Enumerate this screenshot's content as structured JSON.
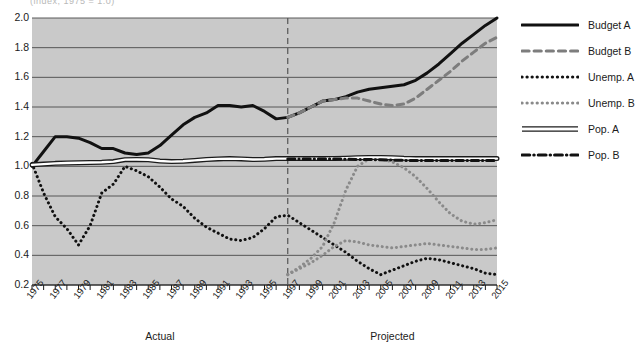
{
  "cut_title": "(index, 1975 = 1.0)",
  "chart_data": {
    "type": "line",
    "title": "",
    "xlabel": "",
    "ylabel": "",
    "xlim": [
      1975,
      2015
    ],
    "ylim": [
      0.2,
      2.0
    ],
    "ytick_labels": [
      "2.0",
      "1.8",
      "1.6",
      "1.4",
      "1.2",
      "1.0",
      "0.8",
      "0.6",
      "0.4",
      "0.2"
    ],
    "ytick_values": [
      2.0,
      1.8,
      1.6,
      1.4,
      1.2,
      1.0,
      0.8,
      0.6,
      0.4,
      0.2
    ],
    "xtick_labels": [
      "1975",
      "1977",
      "1979",
      "1981",
      "1983",
      "1985",
      "1987",
      "1989",
      "1991",
      "1993",
      "1995",
      "1997",
      "1999",
      "2001",
      "2003",
      "2005",
      "2007",
      "2009",
      "2011",
      "2013",
      "2015"
    ],
    "xtick_values": [
      1975,
      1977,
      1979,
      1981,
      1983,
      1985,
      1987,
      1989,
      1991,
      1993,
      1995,
      1997,
      1999,
      2001,
      2003,
      2005,
      2007,
      2009,
      2011,
      2013,
      2015
    ],
    "minor_ticks": true,
    "grid": "horizontal",
    "plot_background": "#c9c9c9",
    "divider": {
      "x": 1997,
      "style": "dashed",
      "color": "#555555"
    },
    "region_labels": [
      {
        "text": "Actual",
        "center_x": 1986
      },
      {
        "text": "Projected",
        "center_x": 2006
      }
    ],
    "x": [
      1975,
      1976,
      1977,
      1978,
      1979,
      1980,
      1981,
      1982,
      1983,
      1984,
      1985,
      1986,
      1987,
      1988,
      1989,
      1990,
      1991,
      1992,
      1993,
      1994,
      1995,
      1996,
      1997,
      1998,
      1999,
      2000,
      2001,
      2002,
      2003,
      2004,
      2005,
      2006,
      2007,
      2008,
      2009,
      2010,
      2011,
      2012,
      2013,
      2014,
      2015
    ],
    "series": [
      {
        "name": "Budget A",
        "style": "solid",
        "color": "#111111",
        "width": 3,
        "values": [
          1.0,
          1.1,
          1.2,
          1.2,
          1.19,
          1.16,
          1.12,
          1.12,
          1.09,
          1.08,
          1.09,
          1.14,
          1.21,
          1.28,
          1.33,
          1.36,
          1.41,
          1.41,
          1.4,
          1.41,
          1.37,
          1.32,
          1.33,
          1.36,
          1.4,
          1.44,
          1.45,
          1.47,
          1.5,
          1.52,
          1.53,
          1.54,
          1.55,
          1.58,
          1.63,
          1.69,
          1.76,
          1.83,
          1.89,
          1.95,
          2.0
        ]
      },
      {
        "name": "Budget B",
        "style": "dashed",
        "color": "#7d7d7d",
        "width": 3,
        "values": [
          null,
          null,
          null,
          null,
          null,
          null,
          null,
          null,
          null,
          null,
          null,
          null,
          null,
          null,
          null,
          null,
          null,
          null,
          null,
          null,
          null,
          null,
          1.33,
          1.36,
          1.4,
          1.44,
          1.45,
          1.46,
          1.46,
          1.44,
          1.42,
          1.41,
          1.42,
          1.46,
          1.52,
          1.58,
          1.64,
          1.71,
          1.77,
          1.83,
          1.87
        ]
      },
      {
        "name": "Unemp. A",
        "style": "dotted",
        "color": "#111111",
        "width": 3,
        "values": [
          1.02,
          0.82,
          0.66,
          0.58,
          0.47,
          0.6,
          0.82,
          0.88,
          1.0,
          0.97,
          0.93,
          0.86,
          0.78,
          0.73,
          0.65,
          0.59,
          0.55,
          0.51,
          0.5,
          0.52,
          0.58,
          0.66,
          0.67,
          0.62,
          0.57,
          0.52,
          0.47,
          0.42,
          0.36,
          0.31,
          0.27,
          0.3,
          0.33,
          0.36,
          0.38,
          0.37,
          0.35,
          0.33,
          0.31,
          0.28,
          0.27
        ]
      },
      {
        "name": "Unemp. B",
        "style": "dotted",
        "color": "#8a8a8a",
        "width": 3,
        "values": [
          null,
          null,
          null,
          null,
          null,
          null,
          null,
          null,
          null,
          null,
          null,
          null,
          null,
          null,
          null,
          null,
          null,
          null,
          null,
          null,
          null,
          null,
          0.27,
          0.31,
          0.35,
          0.4,
          0.46,
          0.5,
          0.49,
          0.47,
          0.46,
          0.45,
          0.46,
          0.47,
          0.48,
          0.47,
          0.46,
          0.45,
          0.44,
          0.44,
          0.45
        ]
      },
      {
        "name": "Unemp. B proj",
        "style": "dotted",
        "color": "#8a8a8a",
        "width": 3,
        "hide_from_legend": true,
        "values": [
          null,
          null,
          null,
          null,
          null,
          null,
          null,
          null,
          null,
          null,
          null,
          null,
          null,
          null,
          null,
          null,
          null,
          null,
          null,
          null,
          null,
          null,
          0.27,
          0.32,
          0.38,
          0.46,
          0.62,
          0.84,
          1.0,
          1.05,
          1.05,
          1.03,
          0.99,
          0.93,
          0.85,
          0.76,
          0.68,
          0.63,
          0.61,
          0.62,
          0.64
        ]
      },
      {
        "name": "Pop. A",
        "style": "outlined",
        "color": "#ffffff",
        "width": 3,
        "values": [
          1.01,
          1.015,
          1.02,
          1.022,
          1.024,
          1.026,
          1.028,
          1.032,
          1.045,
          1.046,
          1.044,
          1.036,
          1.032,
          1.034,
          1.04,
          1.046,
          1.05,
          1.052,
          1.05,
          1.046,
          1.048,
          1.052,
          1.052,
          1.052,
          1.052,
          1.052,
          1.053,
          1.055,
          1.058,
          1.06,
          1.06,
          1.058,
          1.054,
          1.052,
          1.052,
          1.052,
          1.052,
          1.052,
          1.052,
          1.052,
          1.052
        ]
      },
      {
        "name": "Pop. B",
        "style": "dashdot",
        "color": "#111111",
        "width": 3,
        "values": [
          null,
          null,
          null,
          null,
          null,
          null,
          null,
          null,
          null,
          null,
          null,
          null,
          null,
          null,
          null,
          null,
          null,
          null,
          null,
          null,
          null,
          null,
          1.05,
          1.05,
          1.05,
          1.05,
          1.05,
          1.048,
          1.046,
          1.046,
          1.044,
          1.042,
          1.04,
          1.04,
          1.04,
          1.04,
          1.04,
          1.04,
          1.04,
          1.04,
          1.04
        ]
      }
    ]
  },
  "legend": {
    "items": [
      {
        "label": "Budget A",
        "style": "solid",
        "color": "#111111"
      },
      {
        "label": "Budget B",
        "style": "dashed",
        "color": "#7d7d7d"
      },
      {
        "label": "Unemp. A",
        "style": "dotted",
        "color": "#111111"
      },
      {
        "label": "Unemp. B",
        "style": "dotted",
        "color": "#8a8a8a"
      },
      {
        "label": "Pop. A",
        "style": "outlined",
        "color": "#ffffff"
      },
      {
        "label": "Pop. B",
        "style": "dashdot",
        "color": "#111111"
      }
    ]
  }
}
